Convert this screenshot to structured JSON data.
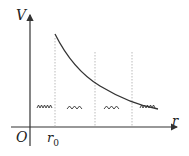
{
  "diagram": {
    "type": "potential-energy-curve",
    "axes": {
      "y_label": "V",
      "x_label": "r",
      "origin_label": "O"
    },
    "marks": {
      "r0_label": "r",
      "r0_subscript": "0"
    },
    "springs": [
      {
        "state": "compressed"
      },
      {
        "state": "stretched"
      },
      {
        "state": "stretched"
      },
      {
        "state": "compressed"
      }
    ],
    "colors": {
      "axis": "#333333",
      "curve": "#333333",
      "dotted": "#aaaaaa"
    }
  }
}
